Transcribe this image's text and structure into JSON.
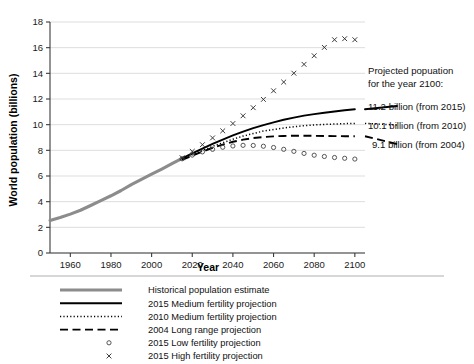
{
  "chart_data": {
    "type": "line",
    "title": "",
    "xlabel": "Year",
    "ylabel": "World population (billions)",
    "xlim": [
      1950,
      2105
    ],
    "ylim": [
      0,
      18
    ],
    "xticks": [
      1960,
      1980,
      2000,
      2020,
      2040,
      2060,
      2080,
      2100
    ],
    "yticks": [
      0,
      2,
      4,
      6,
      8,
      10,
      12,
      14,
      16,
      18
    ],
    "grid": "horizontal",
    "legend_position": "below-axes",
    "series": [
      {
        "name": "Historical population estimate",
        "style": "thick-gray-line",
        "color": "#8c8c8c",
        "x": [
          1950,
          1955,
          1960,
          1965,
          1970,
          1975,
          1980,
          1985,
          1990,
          1995,
          2000,
          2005,
          2010,
          2015
        ],
        "values": [
          2.54,
          2.77,
          3.03,
          3.33,
          3.7,
          4.08,
          4.46,
          4.87,
          5.33,
          5.74,
          6.14,
          6.54,
          6.96,
          7.38
        ]
      },
      {
        "name": "2015 Medium fertility projection",
        "style": "solid-black-line",
        "color": "#000000",
        "x": [
          2015,
          2020,
          2025,
          2030,
          2035,
          2040,
          2045,
          2050,
          2055,
          2060,
          2065,
          2070,
          2075,
          2080,
          2085,
          2090,
          2095,
          2100
        ],
        "values": [
          7.38,
          7.76,
          8.14,
          8.5,
          8.84,
          9.16,
          9.45,
          9.73,
          9.97,
          10.18,
          10.38,
          10.55,
          10.7,
          10.82,
          10.93,
          11.03,
          11.12,
          11.2
        ]
      },
      {
        "name": "2010 Medium fertility projection",
        "style": "dotted-line",
        "color": "#000000",
        "x": [
          2015,
          2020,
          2025,
          2030,
          2035,
          2040,
          2045,
          2050,
          2055,
          2060,
          2065,
          2070,
          2075,
          2080,
          2085,
          2090,
          2095,
          2100
        ],
        "values": [
          7.32,
          7.66,
          7.98,
          8.31,
          8.59,
          8.87,
          9.11,
          9.31,
          9.5,
          9.62,
          9.74,
          9.84,
          9.92,
          9.98,
          10.02,
          10.05,
          10.08,
          10.1
        ]
      },
      {
        "name": "2004 Long range projection",
        "style": "dashed-line",
        "color": "#000000",
        "x": [
          2015,
          2020,
          2025,
          2030,
          2035,
          2040,
          2045,
          2050,
          2055,
          2060,
          2065,
          2070,
          2075,
          2080,
          2085,
          2090,
          2095,
          2100
        ],
        "values": [
          7.25,
          7.58,
          7.9,
          8.2,
          8.45,
          8.67,
          8.83,
          8.96,
          9.04,
          9.09,
          9.12,
          9.14,
          9.14,
          9.13,
          9.12,
          9.11,
          9.1,
          9.1
        ]
      },
      {
        "name": "2015 Low fertility projection",
        "style": "open-circle-markers",
        "color": "#444444",
        "x": [
          2015,
          2020,
          2025,
          2030,
          2035,
          2040,
          2045,
          2050,
          2055,
          2060,
          2065,
          2070,
          2075,
          2080,
          2085,
          2090,
          2095,
          2100
        ],
        "values": [
          7.34,
          7.63,
          7.88,
          8.08,
          8.24,
          8.34,
          8.39,
          8.38,
          8.32,
          8.22,
          8.08,
          7.92,
          7.76,
          7.62,
          7.52,
          7.44,
          7.38,
          7.32
        ]
      },
      {
        "name": "2015 High fertility projection",
        "style": "cross-markers",
        "color": "#333333",
        "x": [
          2015,
          2020,
          2025,
          2030,
          2035,
          2040,
          2045,
          2050,
          2055,
          2060,
          2065,
          2070,
          2075,
          2080,
          2085,
          2090,
          2095,
          2100
        ],
        "values": [
          7.42,
          7.92,
          8.44,
          8.97,
          9.52,
          10.09,
          10.69,
          11.32,
          11.97,
          12.64,
          13.32,
          14.01,
          14.7,
          15.37,
          16.02,
          16.62,
          16.7,
          16.62
        ]
      }
    ],
    "annotations": {
      "heading_line1": "Projected popuation",
      "heading_line2": "for the year 2100:",
      "values": [
        "11.2 billion (from 2015)",
        "10.1 billion (from 2010)",
        "9.1 billion (from 2004)"
      ]
    }
  },
  "legend": {
    "entries": [
      {
        "label": "Historical population estimate",
        "marker": "thick-gray-line"
      },
      {
        "label": "2015 Medium fertility projection",
        "marker": "solid-black-line"
      },
      {
        "label": "2010 Medium fertility projection",
        "marker": "dotted-line"
      },
      {
        "label": "2004 Long range projection",
        "marker": "dashed-line"
      },
      {
        "label": "2015 Low fertility projection",
        "marker": "open-circle-marker"
      },
      {
        "label": "2015 High fertility projection",
        "marker": "cross-marker"
      }
    ]
  },
  "axis": {
    "ylabel": "World population (billions)",
    "xlabel": "Year"
  },
  "colors": {
    "historical": "#8c8c8c",
    "projection": "#000000",
    "grid": "#d9d9d9",
    "axis": "#3a3a3a",
    "background": "#ffffff"
  }
}
